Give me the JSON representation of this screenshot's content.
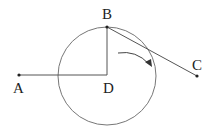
{
  "diagram": {
    "labels": {
      "A": "A",
      "B": "B",
      "C": "C",
      "D": "D"
    },
    "points": {
      "A": [
        19,
        75
      ],
      "B": [
        107,
        27
      ],
      "C": [
        197,
        76
      ],
      "D": [
        107,
        75
      ]
    },
    "circle": {
      "center": "D",
      "cx": 107,
      "cy": 76,
      "r": 49
    },
    "segments": [
      [
        "A",
        "D"
      ],
      [
        "B",
        "D"
      ],
      [
        "B",
        "C"
      ]
    ],
    "arrow": {
      "direction": "clockwise"
    },
    "stroke_color": "#555555"
  }
}
